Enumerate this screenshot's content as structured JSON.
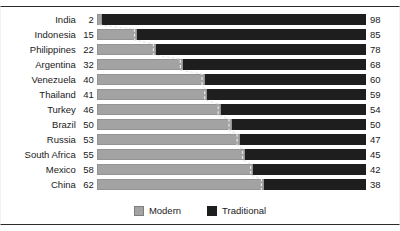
{
  "chart_data": {
    "type": "bar",
    "subtype": "stacked-horizontal-100pct",
    "title": "",
    "subtitle": "",
    "xlabel": "",
    "ylabel": "",
    "xlim": [
      0,
      100
    ],
    "grid": false,
    "legend_position": "bottom-center",
    "categories": [
      "India",
      "Indonesia",
      "Philippines",
      "Argentina",
      "Venezuela",
      "Thailand",
      "Turkey",
      "Brazil",
      "Russia",
      "South Africa",
      "Mexico",
      "China"
    ],
    "series": [
      {
        "name": "Modern",
        "color": "#a3a3a3",
        "values": [
          2,
          15,
          22,
          32,
          40,
          41,
          46,
          50,
          53,
          55,
          58,
          62
        ]
      },
      {
        "name": "Traditional",
        "color": "#1e1e1e",
        "values": [
          98,
          85,
          78,
          68,
          60,
          59,
          54,
          50,
          47,
          45,
          42,
          38
        ]
      }
    ],
    "annotations": {
      "left_value_labels": [
        "2",
        "15",
        "22",
        "32",
        "40",
        "41",
        "46",
        "50",
        "53",
        "55",
        "58",
        "62"
      ],
      "right_value_labels": [
        "98",
        "85",
        "78",
        "68",
        "60",
        "59",
        "54",
        "50",
        "47",
        "45",
        "42",
        "38"
      ],
      "connector_line": "dashed boundary trace between Modern and Traditional segments"
    }
  },
  "legend": {
    "items": [
      {
        "label": "Modern",
        "swatch": "modern-swatch",
        "color": "#a3a3a3"
      },
      {
        "label": "Traditional",
        "swatch": "traditional-swatch",
        "color": "#1e1e1e"
      }
    ]
  },
  "rows": [
    {
      "category": "India",
      "left": "2",
      "right": "98",
      "modern": 2,
      "traditional": 98
    },
    {
      "category": "Indonesia",
      "left": "15",
      "right": "85",
      "modern": 15,
      "traditional": 85
    },
    {
      "category": "Philippines",
      "left": "22",
      "right": "78",
      "modern": 22,
      "traditional": 78
    },
    {
      "category": "Argentina",
      "left": "32",
      "right": "68",
      "modern": 32,
      "traditional": 68
    },
    {
      "category": "Venezuela",
      "left": "40",
      "right": "60",
      "modern": 40,
      "traditional": 60
    },
    {
      "category": "Thailand",
      "left": "41",
      "right": "59",
      "modern": 41,
      "traditional": 59
    },
    {
      "category": "Turkey",
      "left": "46",
      "right": "54",
      "modern": 46,
      "traditional": 54
    },
    {
      "category": "Brazil",
      "left": "50",
      "right": "50",
      "modern": 50,
      "traditional": 50
    },
    {
      "category": "Russia",
      "left": "53",
      "right": "47",
      "modern": 53,
      "traditional": 47
    },
    {
      "category": "South Africa",
      "left": "55",
      "right": "45",
      "modern": 55,
      "traditional": 45
    },
    {
      "category": "Mexico",
      "left": "58",
      "right": "42",
      "modern": 58,
      "traditional": 42
    },
    {
      "category": "China",
      "left": "62",
      "right": "38",
      "modern": 62,
      "traditional": 38
    }
  ],
  "colors": {
    "modern": "#a3a3a3",
    "traditional": "#1e1e1e",
    "text": "#1a1a1a",
    "frame": "#2b2b2b",
    "background": "#ffffff"
  }
}
